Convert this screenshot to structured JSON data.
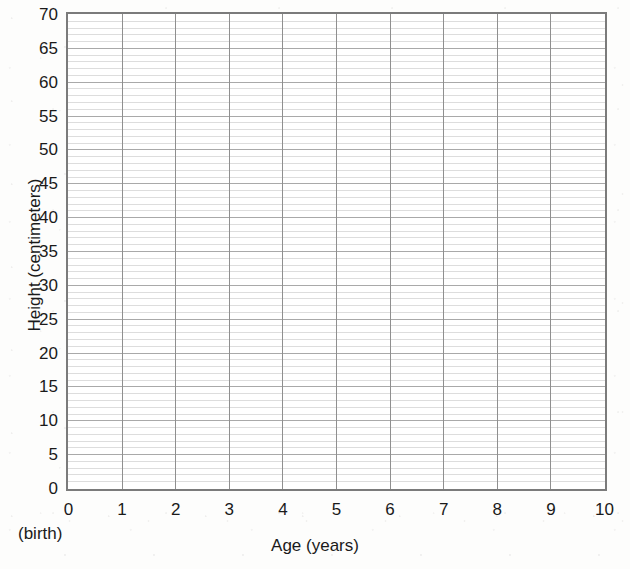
{
  "chart_data": {
    "type": "line",
    "title": "",
    "subtitle": "",
    "xlabel": "Age (years)",
    "ylabel": "Height (centimeters)",
    "xlim": [
      0,
      10
    ],
    "ylim": [
      0,
      70
    ],
    "x_major_step": 1,
    "y_major_step": 5,
    "y_minor_step": 1,
    "grid": true,
    "legend": null,
    "x_tick_labels": [
      "0",
      "1",
      "2",
      "3",
      "4",
      "5",
      "6",
      "7",
      "8",
      "9",
      "10"
    ],
    "x_tick_values": [
      0,
      1,
      2,
      3,
      4,
      5,
      6,
      7,
      8,
      9,
      10
    ],
    "y_tick_labels": [
      "0",
      "5",
      "10",
      "15",
      "20",
      "25",
      "30",
      "35",
      "40",
      "45",
      "50",
      "55",
      "60",
      "65",
      "70"
    ],
    "y_tick_values": [
      0,
      5,
      10,
      15,
      20,
      25,
      30,
      35,
      40,
      45,
      50,
      55,
      60,
      65,
      70
    ],
    "annotations": [
      {
        "text": "(birth)",
        "x": 0,
        "position": "below-x-axis-origin"
      }
    ],
    "series": [],
    "values": [],
    "categories": [],
    "note": "Blank worksheet grid; no data plotted"
  },
  "axes": {
    "x_title": "Age (years)",
    "y_title": "Height (centimeters)",
    "birth_label": "(birth)"
  },
  "colors": {
    "plot_background": "#ffffff",
    "page_background": "#fdfdfc",
    "frame_border": "#7b7b7b",
    "major_gridline": "#a9a9a9",
    "minor_gridline": "#dddddd",
    "vertical_gridline": "#8f8f8f",
    "text": "#1a1a1a"
  }
}
